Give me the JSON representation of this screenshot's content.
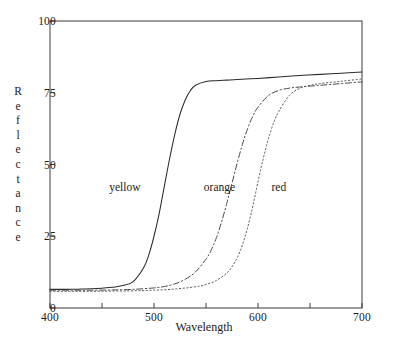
{
  "chart_data": {
    "type": "line",
    "title": "",
    "xlabel": "Wavelength",
    "ylabel": "Reflectance",
    "xlim": [
      400,
      700
    ],
    "ylim": [
      0,
      100
    ],
    "grid": false,
    "legend_position": "inline-annotations",
    "x_ticks_major": [
      400,
      500,
      600,
      700
    ],
    "x_ticks_minor": [
      450,
      550,
      650
    ],
    "y_ticks_major": [
      0,
      25,
      50,
      75,
      100
    ],
    "x_tick_labels": [
      "400",
      "500",
      "600",
      "700"
    ],
    "y_tick_labels": [
      "0",
      "25",
      "50",
      "75",
      "100"
    ],
    "annotations": [
      {
        "text": "yellow",
        "x": 472,
        "y": 42
      },
      {
        "text": "orange",
        "x": 563,
        "y": 42
      },
      {
        "text": "red",
        "x": 620,
        "y": 42
      }
    ],
    "series": [
      {
        "name": "yellow",
        "style": "solid",
        "color": "#2b2b2b",
        "x": [
          400,
          410,
          420,
          430,
          440,
          450,
          460,
          470,
          480,
          490,
          495,
          500,
          505,
          510,
          515,
          520,
          525,
          530,
          535,
          540,
          550,
          560,
          570,
          580,
          600,
          620,
          640,
          660,
          680,
          700
        ],
        "y": [
          6.5,
          6.5,
          6.5,
          6.6,
          6.7,
          6.9,
          7.2,
          7.8,
          9.2,
          14.0,
          18.5,
          25.0,
          33.0,
          42.5,
          52.0,
          60.5,
          67.5,
          72.5,
          75.8,
          77.6,
          78.9,
          79.2,
          79.4,
          79.6,
          80.0,
          80.5,
          81.0,
          81.4,
          81.8,
          82.2
        ]
      },
      {
        "name": "orange",
        "style": "dashdot",
        "color": "#4a4a4a",
        "x": [
          400,
          420,
          440,
          460,
          480,
          500,
          510,
          520,
          530,
          540,
          550,
          555,
          560,
          565,
          570,
          575,
          580,
          585,
          590,
          595,
          600,
          610,
          620,
          630,
          640,
          660,
          680,
          700
        ],
        "y": [
          6.2,
          6.2,
          6.2,
          6.3,
          6.5,
          7.0,
          7.5,
          8.4,
          10.0,
          12.6,
          17.0,
          20.2,
          24.5,
          30.0,
          36.5,
          43.5,
          50.5,
          57.0,
          62.5,
          66.8,
          70.0,
          74.0,
          75.8,
          76.6,
          77.0,
          77.6,
          78.2,
          78.8
        ]
      },
      {
        "name": "red",
        "style": "dotted",
        "color": "#555555",
        "x": [
          400,
          420,
          440,
          460,
          480,
          500,
          520,
          540,
          550,
          560,
          570,
          575,
          580,
          585,
          590,
          595,
          600,
          605,
          610,
          615,
          620,
          630,
          640,
          650,
          660,
          680,
          700
        ],
        "y": [
          5.8,
          5.8,
          5.8,
          5.9,
          6.0,
          6.2,
          6.6,
          7.4,
          8.2,
          9.6,
          12.2,
          14.4,
          17.5,
          22.0,
          28.0,
          35.5,
          44.0,
          52.0,
          59.0,
          64.5,
          68.5,
          74.0,
          76.5,
          77.6,
          78.2,
          79.0,
          79.8
        ]
      }
    ]
  },
  "axes": {
    "y_labels": [
      {
        "value": 100,
        "text": "100"
      },
      {
        "value": 75,
        "text": "75"
      },
      {
        "value": 50,
        "text": "50"
      },
      {
        "value": 25,
        "text": "25"
      },
      {
        "value": 0,
        "text": "0"
      }
    ],
    "x_labels": [
      {
        "value": 400,
        "text": "400"
      },
      {
        "value": 500,
        "text": "500"
      },
      {
        "value": 600,
        "text": "600"
      },
      {
        "value": 700,
        "text": "700"
      }
    ],
    "ylabel_letters": [
      "R",
      "e",
      "f",
      "l",
      "e",
      "c",
      "t",
      "a",
      "n",
      "c",
      "e"
    ],
    "xlabel_text": "Wavelength"
  }
}
